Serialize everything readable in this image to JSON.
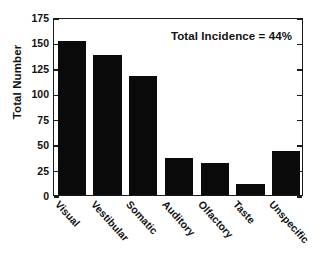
{
  "chart_data": {
    "type": "bar",
    "title": "",
    "xlabel": "",
    "ylabel": "Total Number",
    "categories": [
      "Visual",
      "Vestibular",
      "Somatic",
      "Auditory",
      "Olfactory",
      "Taste",
      "Unspecific"
    ],
    "values": [
      151,
      138,
      117,
      36,
      31,
      11,
      43
    ],
    "ylim": [
      0,
      175
    ],
    "yticks": [
      0,
      25,
      50,
      75,
      100,
      125,
      150,
      175
    ],
    "ytick_labels": [
      "0",
      "25",
      "50",
      "75",
      "100",
      "125",
      "150",
      "175"
    ],
    "grid": false,
    "legend": null,
    "annotations": [
      {
        "name": "total-incidence",
        "text": "Total Incidence = 44%",
        "position": "top-right"
      }
    ],
    "bar_color": "#0a0a0a",
    "axis_color": "#1a1a1a",
    "background": "#ffffff"
  },
  "figure": {
    "ylabel": "Total Number",
    "annotation": "Total Incidence = 44%"
  }
}
